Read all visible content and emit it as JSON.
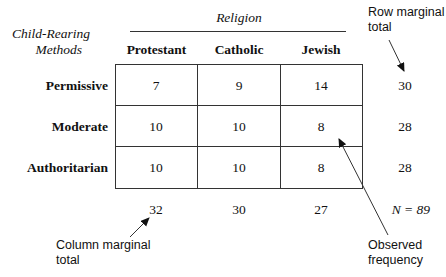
{
  "figure": {
    "row_variable_label_line1": "Child-Rearing",
    "row_variable_label_line2": "Methods",
    "column_variable_label": "Religion",
    "columns": [
      "Protestant",
      "Catholic",
      "Jewish"
    ],
    "rows": [
      {
        "label": "Permissive",
        "values": [
          "7",
          "9",
          "14"
        ],
        "total": "30"
      },
      {
        "label": "Moderate",
        "values": [
          "10",
          "10",
          "8"
        ],
        "total": "28"
      },
      {
        "label": "Authoritarian",
        "values": [
          "10",
          "10",
          "8"
        ],
        "total": "28"
      }
    ],
    "column_totals": [
      "32",
      "30",
      "27"
    ],
    "grand_total": "N = 89",
    "annotations": {
      "row_marginal_line1": "Row marginal",
      "row_marginal_line2": "total",
      "column_marginal_line1": "Column marginal",
      "column_marginal_line2": "total",
      "observed_line1": "Observed",
      "observed_line2": "frequency"
    }
  }
}
